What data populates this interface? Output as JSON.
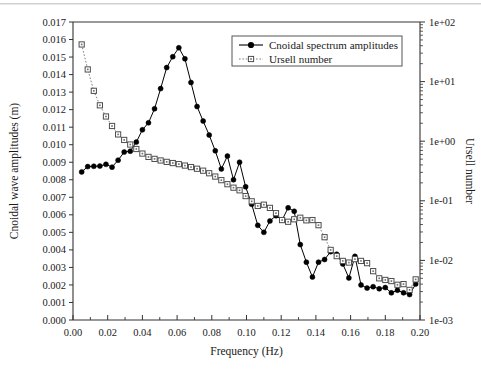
{
  "chart_data": {
    "type": "line",
    "title": "",
    "xlabel": "Frequency (Hz)",
    "ylabel": "Cnoidal wave amplitudes (m)",
    "y2label": "Ursell number",
    "xlim": [
      0.0,
      0.2
    ],
    "ylim": [
      0.0,
      0.017
    ],
    "y2lim": [
      0.001,
      100
    ],
    "y2scale": "log",
    "grid": false,
    "legend_position": "top-right",
    "xticks": [
      "0.00",
      "0.02",
      "0.04",
      "0.06",
      "0.08",
      "0.10",
      "0.12",
      "0.14",
      "0.16",
      "0.18",
      "0.20"
    ],
    "xtick_values": [
      0.0,
      0.02,
      0.04,
      0.06,
      0.08,
      0.1,
      0.12,
      0.14,
      0.16,
      0.18,
      0.2
    ],
    "xminor_step": 0.01,
    "yticks": [
      "0.000",
      "0.001",
      "0.002",
      "0.003",
      "0.004",
      "0.005",
      "0.006",
      "0.007",
      "0.008",
      "0.009",
      "0.010",
      "0.011",
      "0.012",
      "0.013",
      "0.014",
      "0.015",
      "0.016",
      "0.017"
    ],
    "ytick_values": [
      0.0,
      0.001,
      0.002,
      0.003,
      0.004,
      0.005,
      0.006,
      0.007,
      0.008,
      0.009,
      0.01,
      0.011,
      0.012,
      0.013,
      0.014,
      0.015,
      0.016,
      0.017
    ],
    "y2ticks": [
      "1e+02",
      "1e+01",
      "1e+00",
      "1e-01",
      "1e-02",
      "1e-03"
    ],
    "y2tick_values": [
      100,
      10,
      1,
      0.1,
      0.01,
      0.001
    ],
    "series": [
      {
        "name": "Cnoidal spectrum amplitudes",
        "axis": "left",
        "marker": "filled-circle",
        "linestyle": "solid",
        "color": "#000000",
        "x": [
          0.005,
          0.0085,
          0.012,
          0.0155,
          0.019,
          0.0225,
          0.026,
          0.0295,
          0.033,
          0.0365,
          0.04,
          0.0435,
          0.047,
          0.0505,
          0.054,
          0.0575,
          0.061,
          0.0645,
          0.068,
          0.0715,
          0.075,
          0.0785,
          0.082,
          0.0855,
          0.089,
          0.0925,
          0.096,
          0.0995,
          0.103,
          0.1065,
          0.11,
          0.1135,
          0.117,
          0.1205,
          0.124,
          0.1275,
          0.131,
          0.1345,
          0.138,
          0.1415,
          0.145,
          0.1485,
          0.152,
          0.1555,
          0.159,
          0.1625,
          0.166,
          0.1695,
          0.173,
          0.1765,
          0.18,
          0.1835,
          0.187,
          0.1905,
          0.194,
          0.1975
        ],
        "y": [
          0.00845,
          0.00875,
          0.00877,
          0.00878,
          0.00888,
          0.00872,
          0.00912,
          0.00958,
          0.00963,
          0.01015,
          0.01085,
          0.01125,
          0.01205,
          0.0132,
          0.0144,
          0.01502,
          0.01553,
          0.0149,
          0.01355,
          0.01218,
          0.01135,
          0.01055,
          0.00965,
          0.00862,
          0.00935,
          0.008,
          0.009,
          0.0076,
          0.0066,
          0.0054,
          0.005,
          0.00565,
          0.00595,
          0.0057,
          0.0064,
          0.0062,
          0.0043,
          0.0033,
          0.00245,
          0.0033,
          0.00345,
          0.0039,
          0.00375,
          0.0032,
          0.0024,
          0.00363,
          0.002,
          0.00182,
          0.0019,
          0.00178,
          0.00185,
          0.00155,
          0.0017,
          0.00155,
          0.00145,
          0.00205
        ]
      },
      {
        "name": "Ursell number",
        "axis": "right",
        "marker": "open-square",
        "linestyle": "dotted",
        "color": "#707070",
        "x": [
          0.005,
          0.0085,
          0.012,
          0.0155,
          0.019,
          0.0225,
          0.026,
          0.0295,
          0.033,
          0.0365,
          0.04,
          0.0435,
          0.047,
          0.0505,
          0.054,
          0.0575,
          0.061,
          0.0645,
          0.068,
          0.0715,
          0.075,
          0.0785,
          0.082,
          0.0855,
          0.089,
          0.0925,
          0.096,
          0.0995,
          0.103,
          0.1065,
          0.11,
          0.1135,
          0.117,
          0.1205,
          0.124,
          0.1275,
          0.131,
          0.1345,
          0.138,
          0.1415,
          0.145,
          0.1485,
          0.152,
          0.1555,
          0.159,
          0.1625,
          0.166,
          0.1695,
          0.173,
          0.1765,
          0.18,
          0.1835,
          0.187,
          0.1905,
          0.194,
          0.1975
        ],
        "y": [
          42.0,
          16.0,
          7.0,
          4.0,
          2.6,
          1.8,
          1.3,
          1.05,
          0.88,
          0.74,
          0.62,
          0.545,
          0.505,
          0.475,
          0.45,
          0.43,
          0.412,
          0.39,
          0.368,
          0.345,
          0.32,
          0.29,
          0.255,
          0.222,
          0.19,
          0.166,
          0.15,
          0.12,
          0.098,
          0.082,
          0.086,
          0.076,
          0.062,
          0.0475,
          0.0445,
          0.049,
          0.052,
          0.047,
          0.0475,
          0.039,
          0.0245,
          0.015,
          0.0118,
          0.0098,
          0.0092,
          0.0105,
          0.0098,
          0.009,
          0.0066,
          0.005,
          0.0047,
          0.0045,
          0.0039,
          0.004,
          0.0032,
          0.0048
        ]
      }
    ]
  },
  "legend": {
    "items": [
      {
        "label": "Cnoidal spectrum amplitudes",
        "marker": "filled-circle",
        "linestyle": "solid"
      },
      {
        "label": "Ursell number",
        "marker": "open-square",
        "linestyle": "dotted"
      }
    ]
  }
}
